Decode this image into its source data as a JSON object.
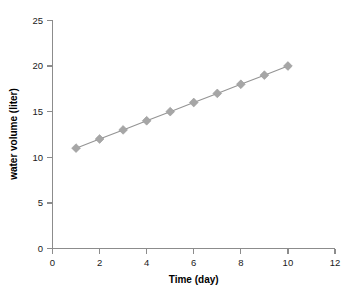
{
  "chart_data": {
    "type": "line",
    "title": "",
    "xlabel": "Time (day)",
    "ylabel": "water volume (liter)",
    "x": [
      1,
      2,
      3,
      4,
      5,
      6,
      7,
      8,
      9,
      10
    ],
    "values": [
      11,
      12,
      13,
      14,
      15,
      16,
      17,
      18,
      19,
      20
    ],
    "series": [
      {
        "name": "water volume",
        "values": [
          11,
          12,
          13,
          14,
          15,
          16,
          17,
          18,
          19,
          20
        ]
      }
    ],
    "xlim": [
      0,
      12
    ],
    "ylim": [
      0,
      25
    ],
    "xticks": [
      0,
      2,
      4,
      6,
      8,
      10,
      12
    ],
    "yticks": [
      0,
      5,
      10,
      15,
      20,
      25
    ],
    "xtick_labels": [
      "0",
      "2",
      "4",
      "6",
      "8",
      "10",
      "12"
    ],
    "ytick_labels": [
      "0",
      "5",
      "10",
      "15",
      "20",
      "25"
    ],
    "grid": false,
    "legend": false,
    "legend_position": "none",
    "marker": "diamond",
    "colors": {
      "line": "#949494",
      "marker": "#a6a6a6",
      "axis": "#8c8c8c",
      "text": "#1a1a1a",
      "background": "#ffffff"
    }
  }
}
